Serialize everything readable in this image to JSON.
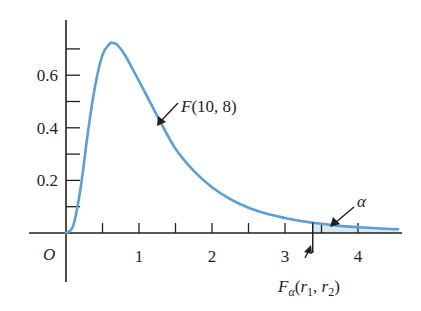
{
  "chart_data": {
    "type": "line",
    "title": "",
    "xlabel": "",
    "ylabel": "",
    "origin_label": "O",
    "xlim": [
      -0.5,
      4.55
    ],
    "ylim": [
      0,
      0.75
    ],
    "grid": false,
    "x_ticks": [
      0.5,
      1,
      1.5,
      2,
      2.5,
      3,
      3.5,
      4
    ],
    "x_tick_labels": [
      {
        "value": 1,
        "label": "1"
      },
      {
        "value": 2,
        "label": "2"
      },
      {
        "value": 3,
        "label": "3"
      },
      {
        "value": 4,
        "label": "4"
      }
    ],
    "y_ticks": [
      0.1,
      0.2,
      0.3,
      0.4,
      0.5,
      0.6,
      0.7
    ],
    "y_tick_labels": [
      {
        "value": 0.2,
        "label": "0.2"
      },
      {
        "value": 0.4,
        "label": "0.4"
      },
      {
        "value": 0.6,
        "label": "0.6"
      }
    ],
    "series": [
      {
        "name": "F(10, 8)",
        "color": "#5b9fd3",
        "x": [
          0,
          0.1,
          0.2,
          0.3,
          0.4,
          0.5,
          0.6,
          0.64,
          0.7,
          0.8,
          0.9,
          1.0,
          1.25,
          1.5,
          1.75,
          2.0,
          2.25,
          2.5,
          2.75,
          3.0,
          3.25,
          3.5,
          3.75,
          4.0,
          4.25,
          4.55
        ],
        "y": [
          0,
          0.029,
          0.171,
          0.383,
          0.561,
          0.677,
          0.72,
          0.723,
          0.716,
          0.68,
          0.63,
          0.578,
          0.445,
          0.32,
          0.236,
          0.174,
          0.129,
          0.096,
          0.073,
          0.057,
          0.044,
          0.035,
          0.027,
          0.022,
          0.018,
          0.014
        ]
      }
    ],
    "shaded_region": {
      "from_x": 3.38,
      "to_x": 4.55,
      "color": "#d5eaf5",
      "label": "α"
    },
    "annotations": [
      {
        "text": "F(10, 8)",
        "points_to": "curve",
        "at_x": 1.27
      },
      {
        "text": "α",
        "points_to": "shaded tail area"
      },
      {
        "text": "Fα(r1, r2)",
        "points_to": "critical value",
        "at_x": 3.38
      }
    ]
  },
  "labels": {
    "origin": "O",
    "curve_name_F": "F",
    "curve_name_args": "(10, 8)",
    "alpha": "α",
    "crit_F": "F",
    "crit_sub_alpha": "α",
    "crit_open": "(",
    "crit_r": "r",
    "crit_sub_1": "1",
    "crit_sep": ", ",
    "crit_sub_2": "2",
    "crit_close": ")"
  }
}
